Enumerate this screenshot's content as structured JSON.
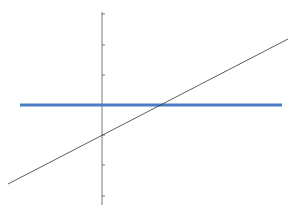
{
  "chart_data": {
    "type": "line",
    "title": "",
    "xlabel": "",
    "ylabel": "",
    "grid": false,
    "legend": null,
    "xlim": [
      -3.1,
      6.2
    ],
    "ylim": [
      -3.3,
      3.0
    ],
    "y_ticks": [
      3,
      2,
      1,
      0,
      -1,
      -2,
      -3
    ],
    "series": [
      {
        "name": "horizontal line",
        "color": "#4a7cc7",
        "width": 3,
        "x": [
          -2.73,
          6.0
        ],
        "y": [
          0,
          0
        ]
      },
      {
        "name": "diagonal line",
        "color": "#333333",
        "width": 0.8,
        "x": [
          -3.13,
          6.2
        ],
        "y": [
          -2.6,
          2.2
        ],
        "equation": "y = 0.5x - 1"
      }
    ]
  },
  "pixel": {
    "axis_x": 102,
    "axis_top": 12,
    "axis_bottom": 205,
    "ticks_y": [
      14,
      45,
      75,
      105,
      135,
      165,
      196
    ],
    "blue": {
      "x1": 20,
      "y1": 105,
      "x2": 282,
      "y2": 105
    },
    "diag": {
      "x1": 8,
      "y1": 184,
      "x2": 288,
      "y2": 39
    }
  }
}
